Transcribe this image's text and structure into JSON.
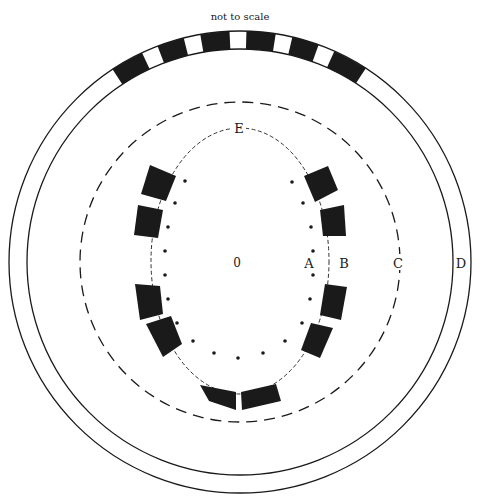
{
  "caption": "not to scale",
  "labels": {
    "center": "0",
    "A": "A",
    "B": "B",
    "C": "C",
    "D": "D",
    "E": "E"
  },
  "colors": {
    "ink": "#1a1a1a",
    "paper": "#ffffff"
  },
  "geometry": {
    "center": [
      240,
      262
    ],
    "outer_ring_outer_radius": 231,
    "outer_ring_inner_radius": 213,
    "dashed_circle_C_radius": 160,
    "ellipse_B": {
      "rx": 89,
      "ry": 133
    },
    "ring_black_arc_degrees": [
      -33.5,
      33
    ],
    "ring_white_gap_centers_degrees": [
      -23,
      -12,
      -0.5,
      11,
      22
    ],
    "ring_white_gap_width_degrees": 4.2
  },
  "dots_A": [
    [
      185,
      181
    ],
    [
      175,
      203
    ],
    [
      168,
      227
    ],
    [
      165,
      251
    ],
    [
      165,
      275
    ],
    [
      168,
      299
    ],
    [
      177,
      323
    ],
    [
      193,
      341
    ],
    [
      214,
      353
    ],
    [
      238,
      358
    ],
    [
      263,
      353
    ],
    [
      285,
      341
    ],
    [
      302,
      323
    ],
    [
      310,
      299
    ],
    [
      313,
      275
    ],
    [
      313,
      251
    ],
    [
      311,
      227
    ],
    [
      303,
      203
    ],
    [
      292,
      182
    ]
  ],
  "blocks": [
    [
      [
        150,
        165
      ],
      [
        176,
        176
      ],
      [
        166,
        201
      ],
      [
        141,
        194
      ]
    ],
    [
      [
        138,
        205
      ],
      [
        163,
        210
      ],
      [
        158,
        238
      ],
      [
        134,
        235
      ]
    ],
    [
      [
        135,
        284
      ],
      [
        160,
        286
      ],
      [
        163,
        314
      ],
      [
        140,
        320
      ]
    ],
    [
      [
        146,
        324
      ],
      [
        171,
        316
      ],
      [
        182,
        344
      ],
      [
        163,
        357
      ]
    ],
    [
      [
        304,
        176
      ],
      [
        328,
        166
      ],
      [
        338,
        190
      ],
      [
        315,
        202
      ]
    ],
    [
      [
        320,
        210
      ],
      [
        344,
        205
      ],
      [
        346,
        236
      ],
      [
        323,
        236
      ]
    ],
    [
      [
        325,
        284
      ],
      [
        347,
        287
      ],
      [
        341,
        320
      ],
      [
        320,
        315
      ]
    ],
    [
      [
        311,
        323
      ],
      [
        333,
        328
      ],
      [
        320,
        358
      ],
      [
        301,
        350
      ]
    ],
    [
      [
        200,
        385
      ],
      [
        236,
        392
      ],
      [
        236,
        410
      ],
      [
        209,
        401
      ]
    ],
    [
      [
        241,
        392
      ],
      [
        276,
        384
      ],
      [
        281,
        401
      ],
      [
        242,
        410
      ]
    ]
  ]
}
